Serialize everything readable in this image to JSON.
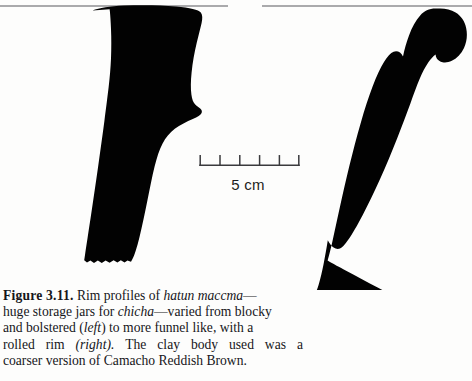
{
  "page": {
    "background": "#fdfdfc",
    "ink": "#000000"
  },
  "figure": {
    "number": "Figure 3.11.",
    "caption_full": "Figure 3.11. Rim profiles of hatun maccma—huge storage jars for chicha—varied from blocky and bolstered (left) to more funnel like, with a rolled rim (right). The clay body used was a coarser version of Camacho Reddish Brown.",
    "lines": [
      {
        "id": "line1",
        "parts": [
          "Figure 3.11.",
          " Rim profiles of ",
          "hatun maccma",
          "—"
        ]
      },
      {
        "id": "line2",
        "parts": [
          "huge storage jars for ",
          "chicha",
          "—varied from blocky"
        ]
      },
      {
        "id": "line3",
        "parts": [
          "and bolstered (",
          "left",
          ") to more funnel like, with a"
        ]
      },
      {
        "id": "line4",
        "parts": [
          "rolled rim (",
          "right",
          "). The clay body used was a"
        ]
      },
      {
        "id": "line5",
        "parts": [
          "coarser version of Camacho Reddish Brown."
        ]
      }
    ],
    "line4_words": [
      "rolled",
      "rim",
      "(right).",
      "The",
      "clay",
      "body",
      "used",
      "was",
      "a"
    ],
    "italic_terms": [
      "hatun maccma",
      "chicha",
      "left",
      "right"
    ],
    "profiles": [
      {
        "name": "blocky-bolstered-rim-profile",
        "position": "left",
        "description": "blocky and bolstered rim profile of hatun maccma jar"
      },
      {
        "name": "funnel-rolled-rim-profile",
        "position": "right",
        "description": "funnel like profile with rolled rim"
      }
    ],
    "rim_lines": [
      {
        "name": "left-rim-line",
        "x1": 0,
        "x2": 228,
        "y": 6
      },
      {
        "name": "right-rim-line",
        "x1": 262,
        "x2": 472,
        "y": 6
      }
    ]
  },
  "scale": {
    "label": "5 cm",
    "units": "cm",
    "total": 5,
    "divisions": 5,
    "tick_count": 6,
    "bar_x_start": 200,
    "bar_x_end": 299,
    "bar_y": 165
  }
}
